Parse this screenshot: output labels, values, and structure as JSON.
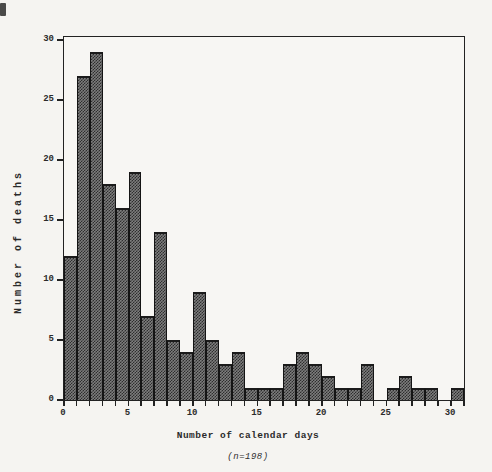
{
  "figure": {
    "y_axis_title": "Number of deaths",
    "x_axis_title": "Number of calendar days",
    "footnote": "(n=198)"
  },
  "chart_data": {
    "type": "bar",
    "title": "",
    "xlabel": "Number of calendar days",
    "ylabel": "Number of deaths",
    "annotation": "(n=198)",
    "n_total": 198,
    "bin_width": 1,
    "x": [
      0,
      1,
      2,
      3,
      4,
      5,
      6,
      7,
      8,
      9,
      10,
      11,
      12,
      13,
      14,
      15,
      16,
      17,
      18,
      19,
      20,
      21,
      22,
      23,
      24,
      25,
      26,
      27,
      28,
      29,
      30
    ],
    "values": [
      12,
      27,
      29,
      18,
      16,
      19,
      7,
      14,
      5,
      4,
      9,
      5,
      3,
      4,
      1,
      1,
      1,
      3,
      4,
      3,
      2,
      1,
      1,
      3,
      0,
      1,
      2,
      1,
      1,
      0,
      1
    ],
    "xlim": [
      0,
      31
    ],
    "ylim": [
      0,
      30
    ],
    "x_tick_step_minor": 1,
    "x_tick_labels": [
      0,
      5,
      10,
      15,
      20,
      25,
      30
    ],
    "y_tick_labels": [
      0,
      5,
      10,
      15,
      20,
      25,
      30
    ],
    "grid": false,
    "legend": "none",
    "bar_fill_color": "#4a4a4a",
    "bar_edge_color": "#1b1b1b",
    "frame_color": "#222222",
    "background_color": "#f5f4f1"
  }
}
